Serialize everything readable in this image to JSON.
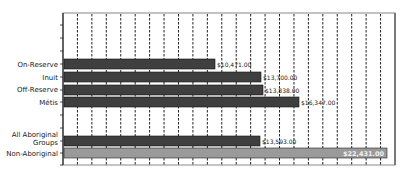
{
  "chart_data": {
    "type": "bar",
    "orientation": "horizontal",
    "title": "",
    "xlabel": "",
    "ylabel": "",
    "categories": [
      "On-Reserve",
      "Inuit",
      "Off-Reserve",
      "Métis",
      "",
      "All Aboriginal Groups",
      "Non-Aboriginal"
    ],
    "values": [
      10471.0,
      13700.0,
      13838.0,
      16347.0,
      null,
      13593.0,
      22431.0
    ],
    "value_labels": [
      "$10,471.00",
      "$13,700.00",
      "$13,838.00",
      "$16,347.00",
      "",
      "$13,593.00",
      "$22,431.00"
    ],
    "bar_colors": [
      "#3f3f3f",
      "#3f3f3f",
      "#3f3f3f",
      "#3f3f3f",
      "",
      "#3f3f3f",
      "#9a9a9a"
    ],
    "xlim": [
      0,
      23000
    ],
    "grid": {
      "vertical": true,
      "style": "dashed",
      "count": 22
    },
    "legend": null
  },
  "labels": {
    "on_reserve": "On-Reserve",
    "inuit": "Inuit",
    "off_reserve": "Off-Reserve",
    "metis": "Métis",
    "all_aboriginal_line1": "All Aboriginal",
    "all_aboriginal_line2": "Groups",
    "non_aboriginal": "Non-Aboriginal"
  },
  "values_text": {
    "on_reserve": "$10,471.00",
    "inuit": "$13,700.00",
    "off_reserve": "$13,838.00",
    "metis": "$16,347.00",
    "all_aboriginal": "$13,593.00",
    "non_aboriginal": "$22,431.00"
  }
}
